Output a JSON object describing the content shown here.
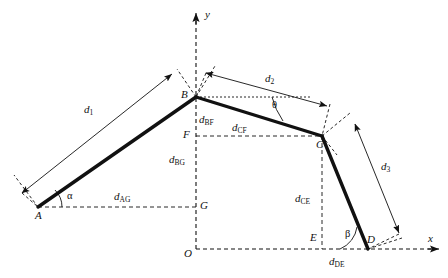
{
  "figure": {
    "type": "geometry-diagram",
    "background_color": "#ffffff",
    "line_color": "#111111",
    "axes": {
      "x_axis_label": "x",
      "y_axis_label": "y",
      "origin_label": "O"
    },
    "points": [
      {
        "name": "point-A",
        "label": "A",
        "x": 38,
        "y": 207
      },
      {
        "name": "point-B",
        "label": "B",
        "x": 196,
        "y": 97
      },
      {
        "name": "point-C",
        "label": "C",
        "x": 322,
        "y": 136
      },
      {
        "name": "point-D",
        "label": "D",
        "x": 368,
        "y": 249
      },
      {
        "name": "point-E",
        "label": "E",
        "x": 322,
        "y": 249
      },
      {
        "name": "point-F",
        "label": "F",
        "x": 196,
        "y": 136
      },
      {
        "name": "point-G",
        "label": "G",
        "x": 196,
        "y": 207
      },
      {
        "name": "point-O",
        "label": "O",
        "x": 196,
        "y": 249
      }
    ],
    "segments": [
      {
        "name": "segment-AB",
        "from": "A",
        "to": "B"
      },
      {
        "name": "segment-BC",
        "from": "B",
        "to": "C"
      },
      {
        "name": "segment-CD",
        "from": "C",
        "to": "D"
      }
    ],
    "dimensions": [
      {
        "name": "dimension-d1",
        "symbol": "d",
        "subscript": "1"
      },
      {
        "name": "dimension-d2",
        "symbol": "d",
        "subscript": "2"
      },
      {
        "name": "dimension-d3",
        "symbol": "d",
        "subscript": "3"
      },
      {
        "name": "dimension-dBF",
        "symbol": "d",
        "subscript": "BF"
      },
      {
        "name": "dimension-dCF",
        "symbol": "d",
        "subscript": "CF"
      },
      {
        "name": "dimension-dBG",
        "symbol": "d",
        "subscript": "BG"
      },
      {
        "name": "dimension-dAG",
        "symbol": "d",
        "subscript": "AG"
      },
      {
        "name": "dimension-dCE",
        "symbol": "d",
        "subscript": "CE"
      },
      {
        "name": "dimension-dDE",
        "symbol": "d",
        "subscript": "DE"
      }
    ],
    "angles": [
      {
        "name": "angle-alpha",
        "label": "α",
        "vertex": "A"
      },
      {
        "name": "angle-theta",
        "label": "θ",
        "vertex": "B"
      },
      {
        "name": "angle-beta",
        "label": "β",
        "vertex": "D"
      }
    ],
    "labels": {
      "A": "A",
      "B": "B",
      "C": "C",
      "D": "D",
      "E": "E",
      "F": "F",
      "G": "G",
      "O": "O",
      "x": "x",
      "y": "y",
      "alpha": "α",
      "beta": "β",
      "theta": "θ",
      "d": "d",
      "sub_1": "1",
      "sub_2": "2",
      "sub_3": "3",
      "sub_BF": "BF",
      "sub_CF": "CF",
      "sub_BG": "BG",
      "sub_AG": "AG",
      "sub_CE": "CE",
      "sub_DE": "DE"
    }
  }
}
